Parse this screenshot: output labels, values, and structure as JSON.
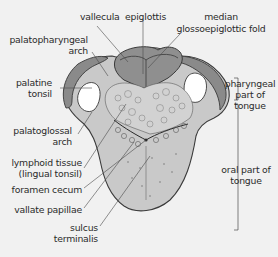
{
  "colors": {
    "background": "#f1f1f1",
    "tongue_fill": "#c9c9c9",
    "tongue_outline": "#3a3a3a",
    "epiglottis_fill": "#8f8f8f",
    "arch_fill": "#8a8a8a",
    "pharyngeal_wall": "#b8b8b8",
    "tonsil_fill": "#ffffff",
    "lymphoid_fill": "#d2d2d2",
    "leader_line": "#4a4a4a",
    "text": "#2b2b2b"
  },
  "labels": {
    "vallecula": "vallecula",
    "epiglottis": "epiglottis",
    "median_fold_line1": "median",
    "median_fold_line2": "glossoepiglottic fold",
    "palatopharyngeal_line1": "palatopharyngeal",
    "palatopharyngeal_line2": "arch",
    "palatine_tonsil_line1": "palatine",
    "palatine_tonsil_line2": "tonsil",
    "palatoglossal_line1": "palatoglossal",
    "palatoglossal_line2": "arch",
    "lymphoid_line1": "lymphoid tissue",
    "lymphoid_line2": "(lingual tonsil)",
    "foramen_cecum": "foramen cecum",
    "vallate_papillae": "vallate papillae",
    "sulcus_line1": "sulcus",
    "sulcus_line2": "terminalis",
    "pharyngeal_part_line1": "pharyngeal",
    "pharyngeal_part_line2": "part of",
    "pharyngeal_part_line3": "tongue",
    "oral_part_line1": "oral part of",
    "oral_part_line2": "tongue"
  }
}
